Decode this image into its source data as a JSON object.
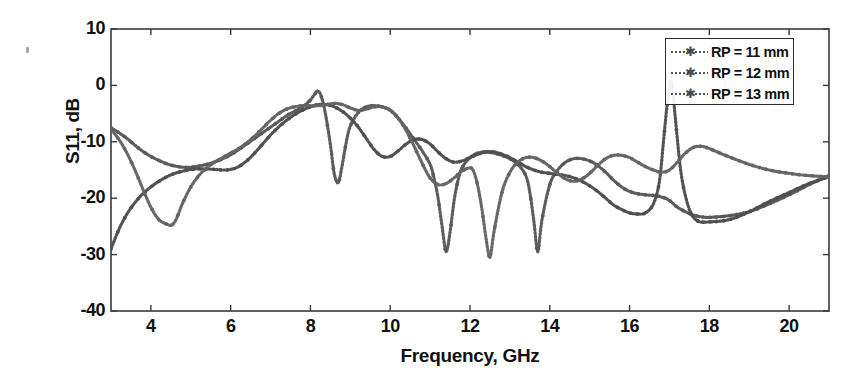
{
  "chart_data": {
    "type": "line",
    "title": "",
    "xlabel": "Frequency, GHz",
    "ylabel": "S11, dB",
    "xlim": [
      3,
      21
    ],
    "ylim": [
      -40,
      10
    ],
    "xticks": [
      4,
      6,
      8,
      10,
      12,
      14,
      16,
      18,
      20
    ],
    "yticks": [
      10,
      0,
      -10,
      -20,
      -30,
      -40
    ],
    "grid": false,
    "legend_position": "top-right",
    "marker": "star-dotted",
    "series": [
      {
        "name": "RP = 11 mm",
        "color": "#595959",
        "x": [
          3.0,
          3.2,
          3.4,
          3.6,
          3.8,
          4.0,
          4.2,
          4.4,
          4.6,
          4.8,
          5.0,
          5.2,
          5.4,
          5.6,
          5.8,
          6.0,
          6.2,
          6.4,
          6.6,
          6.8,
          7.0,
          7.2,
          7.4,
          7.6,
          7.8,
          8.0,
          8.1,
          8.2,
          8.3,
          8.4,
          8.5,
          8.6,
          8.7,
          8.8,
          8.9,
          9.0,
          9.2,
          9.4,
          9.6,
          9.8,
          10.0,
          10.2,
          10.4,
          10.6,
          10.8,
          11.0,
          11.1,
          11.2,
          11.3,
          11.4,
          11.5,
          11.6,
          11.7,
          11.8,
          12.0,
          12.2,
          12.4,
          12.6,
          12.8,
          13.0,
          13.2,
          13.4,
          13.5,
          13.6,
          13.7,
          13.8,
          14.0,
          14.2,
          14.4,
          14.6,
          14.8,
          15.0,
          15.2,
          15.4,
          15.6,
          15.8,
          16.0,
          16.2,
          16.4,
          16.6,
          16.7,
          16.8,
          16.9,
          17.0,
          17.1,
          17.2,
          17.4,
          17.6,
          17.8,
          18.0,
          18.5,
          19.0,
          19.5,
          20.0,
          20.5,
          21.0
        ],
        "y": [
          -7.5,
          -8.4,
          -9.4,
          -10.6,
          -11.7,
          -12.6,
          -13.3,
          -13.9,
          -14.3,
          -14.5,
          -14.5,
          -14.3,
          -14.0,
          -13.6,
          -13.0,
          -12.3,
          -11.4,
          -10.4,
          -9.4,
          -8.4,
          -7.4,
          -6.4,
          -5.4,
          -4.6,
          -3.8,
          -2.6,
          -1.6,
          -1.0,
          -2.6,
          -6.0,
          -10.5,
          -15.8,
          -17.2,
          -14.0,
          -10.0,
          -7.2,
          -4.8,
          -3.8,
          -3.6,
          -3.8,
          -4.4,
          -5.8,
          -7.6,
          -9.6,
          -11.6,
          -14.0,
          -16.5,
          -20.0,
          -25.0,
          -29.5,
          -26.0,
          -20.5,
          -16.8,
          -14.6,
          -12.8,
          -12.0,
          -11.8,
          -12.0,
          -12.4,
          -13.0,
          -14.0,
          -16.0,
          -19.0,
          -24.0,
          -29.5,
          -24.0,
          -17.6,
          -15.0,
          -13.6,
          -13.0,
          -13.0,
          -13.4,
          -14.2,
          -15.4,
          -16.8,
          -18.0,
          -18.8,
          -19.2,
          -19.4,
          -19.5,
          -19.6,
          -19.8,
          -20.0,
          -20.4,
          -21.0,
          -21.6,
          -22.4,
          -23.0,
          -23.3,
          -23.4,
          -23.1,
          -22.4,
          -21.0,
          -19.4,
          -17.6,
          -16.0
        ]
      },
      {
        "name": "RP = 12 mm",
        "color": "#4f4f4f",
        "x": [
          3.0,
          3.2,
          3.4,
          3.6,
          3.8,
          4.0,
          4.2,
          4.4,
          4.6,
          4.8,
          5.0,
          5.2,
          5.4,
          5.6,
          5.8,
          6.0,
          6.2,
          6.4,
          6.6,
          6.8,
          7.0,
          7.2,
          7.4,
          7.6,
          7.8,
          8.0,
          8.2,
          8.4,
          8.6,
          8.8,
          9.0,
          9.2,
          9.4,
          9.6,
          9.8,
          10.0,
          10.2,
          10.4,
          10.6,
          10.8,
          11.0,
          11.2,
          11.4,
          11.6,
          11.8,
          12.0,
          12.2,
          12.4,
          12.6,
          12.8,
          13.0,
          13.2,
          13.4,
          13.6,
          13.8,
          14.0,
          14.2,
          14.4,
          14.6,
          14.8,
          15.0,
          15.2,
          15.4,
          15.6,
          15.8,
          16.0,
          16.2,
          16.4,
          16.6,
          16.75,
          16.85,
          16.95,
          17.05,
          17.15,
          17.3,
          17.5,
          17.7,
          18.0,
          18.5,
          19.0,
          19.5,
          20.0,
          20.5,
          21.0
        ],
        "y": [
          -29.0,
          -25.5,
          -22.8,
          -20.8,
          -19.2,
          -18.0,
          -17.0,
          -16.2,
          -15.6,
          -15.2,
          -14.9,
          -14.8,
          -14.8,
          -14.9,
          -15.0,
          -14.9,
          -14.4,
          -13.4,
          -12.0,
          -10.4,
          -8.8,
          -7.4,
          -6.2,
          -5.2,
          -4.4,
          -3.8,
          -3.4,
          -3.4,
          -3.8,
          -4.6,
          -5.8,
          -7.4,
          -9.4,
          -11.4,
          -12.6,
          -12.6,
          -11.6,
          -10.4,
          -9.6,
          -9.6,
          -10.4,
          -11.8,
          -13.0,
          -13.6,
          -13.4,
          -12.8,
          -12.2,
          -11.8,
          -11.8,
          -12.2,
          -12.8,
          -13.6,
          -14.4,
          -15.0,
          -15.4,
          -15.6,
          -15.8,
          -16.0,
          -16.4,
          -17.0,
          -17.8,
          -18.8,
          -20.0,
          -21.2,
          -22.0,
          -22.6,
          -22.8,
          -22.6,
          -21.0,
          -17.0,
          -10.0,
          -3.0,
          0.8,
          -6.0,
          -16.0,
          -22.0,
          -24.0,
          -24.2,
          -23.8,
          -22.4,
          -20.6,
          -19.0,
          -17.4,
          -16.2
        ]
      },
      {
        "name": "RP = 13 mm",
        "color": "#646464",
        "x": [
          3.0,
          3.2,
          3.4,
          3.6,
          3.8,
          4.0,
          4.2,
          4.4,
          4.5,
          4.6,
          4.7,
          4.8,
          5.0,
          5.2,
          5.4,
          5.6,
          5.8,
          6.0,
          6.2,
          6.4,
          6.6,
          6.8,
          7.0,
          7.2,
          7.4,
          7.6,
          7.8,
          8.0,
          8.2,
          8.4,
          8.6,
          8.8,
          9.0,
          9.2,
          9.4,
          9.6,
          9.8,
          10.0,
          10.2,
          10.4,
          10.6,
          10.8,
          11.0,
          11.2,
          11.4,
          11.6,
          11.8,
          12.0,
          12.1,
          12.2,
          12.3,
          12.4,
          12.5,
          12.6,
          12.8,
          13.0,
          13.2,
          13.4,
          13.6,
          13.8,
          14.0,
          14.2,
          14.4,
          14.6,
          14.8,
          15.0,
          15.2,
          15.4,
          15.6,
          15.8,
          16.0,
          16.2,
          16.4,
          16.6,
          16.8,
          17.0,
          17.2,
          17.4,
          17.6,
          17.8,
          18.0,
          18.4,
          19.0,
          19.5,
          20.0,
          20.5,
          21.0
        ],
        "y": [
          -7.8,
          -9.6,
          -12.0,
          -15.0,
          -18.4,
          -21.6,
          -23.8,
          -24.6,
          -24.8,
          -24.2,
          -22.6,
          -20.8,
          -18.0,
          -16.0,
          -14.6,
          -13.6,
          -12.8,
          -12.0,
          -11.2,
          -10.2,
          -9.0,
          -7.6,
          -6.2,
          -5.0,
          -4.2,
          -3.8,
          -3.6,
          -3.6,
          -3.6,
          -3.4,
          -3.2,
          -3.4,
          -4.0,
          -4.4,
          -4.2,
          -3.8,
          -3.8,
          -4.4,
          -5.8,
          -8.0,
          -10.8,
          -13.8,
          -16.4,
          -17.6,
          -17.4,
          -16.4,
          -15.2,
          -14.6,
          -15.4,
          -18.0,
          -22.0,
          -27.0,
          -30.5,
          -26.0,
          -19.0,
          -15.4,
          -13.6,
          -12.8,
          -12.8,
          -13.4,
          -14.4,
          -15.6,
          -16.6,
          -17.0,
          -16.6,
          -15.6,
          -14.2,
          -13.0,
          -12.4,
          -12.4,
          -12.8,
          -13.6,
          -14.4,
          -15.0,
          -15.4,
          -15.0,
          -13.6,
          -12.0,
          -11.0,
          -10.8,
          -11.2,
          -12.4,
          -14.0,
          -15.0,
          -15.6,
          -16.0,
          -16.2
        ]
      }
    ]
  },
  "axes": {
    "xtick_labels": [
      "4",
      "6",
      "8",
      "10",
      "12",
      "14",
      "16",
      "18",
      "20"
    ],
    "ytick_labels": [
      "10",
      "0",
      "-10",
      "-20",
      "-30",
      "-40"
    ],
    "xlabel": "Frequency, GHz",
    "ylabel": "S11, dB"
  },
  "legend": {
    "items": [
      {
        "label": "RP = 11 mm"
      },
      {
        "label": "RP = 12 mm"
      },
      {
        "label": "RP = 13 mm"
      }
    ]
  }
}
